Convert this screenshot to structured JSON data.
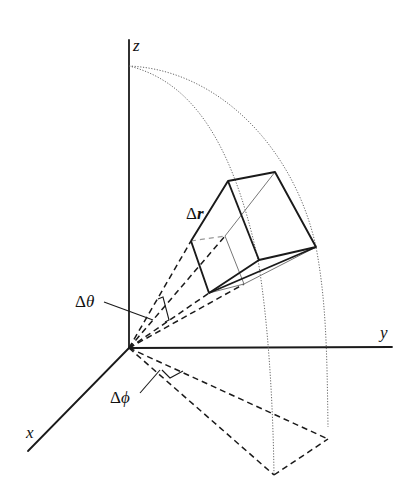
{
  "figure": {
    "axes": {
      "z": {
        "label": "z"
      },
      "y": {
        "label": "y"
      },
      "x": {
        "label": "x"
      }
    },
    "annotations": {
      "delta_r": {
        "symbol": "Δ",
        "var": "r"
      },
      "delta_theta": {
        "symbol": "Δ",
        "var": "θ"
      },
      "delta_phi": {
        "symbol": "Δ",
        "var": "ϕ"
      }
    },
    "colors": {
      "line": "#1a1a1a",
      "arc": "#555555",
      "background": "#ffffff"
    }
  }
}
